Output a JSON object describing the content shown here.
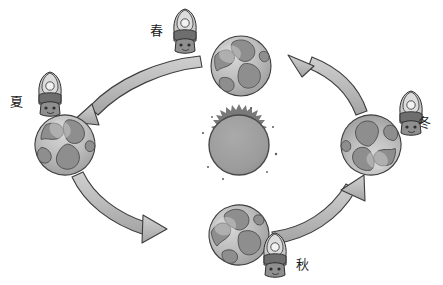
{
  "diagram": {
    "background_color": "#ffffff",
    "direction": "counterclockwise",
    "sun": {
      "name": "sun",
      "label": "",
      "body_color": "#9c9c9c",
      "outline_color": "#4a4a4a",
      "corona_color": "#6e6e6e",
      "center": {
        "x": 239,
        "y": 145
      },
      "radius": 34
    },
    "seasons": [
      {
        "key": "spring",
        "label": "春",
        "position": "top",
        "label_x": 150,
        "label_y": 24,
        "earth": {
          "cx": 241,
          "cy": 66,
          "r": 30
        },
        "figure": {
          "x": 168,
          "y": 8,
          "w": 34,
          "h": 46
        }
      },
      {
        "key": "summer",
        "label": "夏",
        "position": "left",
        "label_x": 10,
        "label_y": 95,
        "earth": {
          "cx": 65,
          "cy": 145,
          "r": 30
        },
        "figure": {
          "x": 33,
          "y": 73,
          "w": 34,
          "h": 46
        }
      },
      {
        "key": "autumn",
        "label": "秋",
        "position": "bottom",
        "label_x": 296,
        "label_y": 258,
        "earth": {
          "cx": 239,
          "cy": 235,
          "r": 30
        },
        "figure": {
          "x": 258,
          "y": 234,
          "w": 34,
          "h": 46
        }
      },
      {
        "key": "winter",
        "label": "冬",
        "position": "right",
        "label_x": 418,
        "label_y": 116,
        "earth": {
          "cx": 371,
          "cy": 145,
          "r": 30
        },
        "figure": {
          "x": 396,
          "y": 92,
          "w": 32,
          "h": 48
        }
      }
    ],
    "earth_style": {
      "ocean_color": "#b4b4b4",
      "land_color": "#8e8e8e",
      "highlight_color": "#d2d2d2",
      "outline_color": "#3d3d3d"
    },
    "arrows": [
      {
        "name": "arrow-spring-to-summer",
        "from": "spring",
        "to": "summer",
        "label": "",
        "fill": "#b5b5b5",
        "stroke": "#3d3d3d"
      },
      {
        "name": "arrow-summer-to-autumn",
        "from": "summer",
        "to": "autumn",
        "label": "",
        "fill": "#b5b5b5",
        "stroke": "#3d3d3d"
      },
      {
        "name": "arrow-autumn-to-winter",
        "from": "autumn",
        "to": "winter",
        "label": "",
        "fill": "#b5b5b5",
        "stroke": "#3d3d3d"
      },
      {
        "name": "arrow-winter-to-spring",
        "from": "winter",
        "to": "spring",
        "label": "",
        "fill": "#b5b5b5",
        "stroke": "#3d3d3d"
      }
    ],
    "figure_style": {
      "body_color": "#c8c8c8",
      "dark_color": "#5a5a5a",
      "face_color": "#e8e8e8",
      "outline_color": "#2e2e2e"
    }
  }
}
